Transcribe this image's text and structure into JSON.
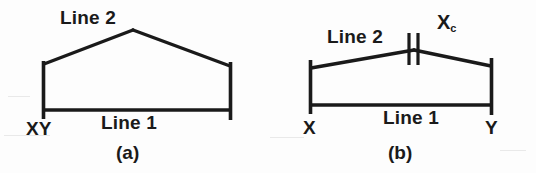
{
  "figure": {
    "background_color": "#fdfdfd",
    "ink_color": "#1a1a1a",
    "panels": [
      {
        "id": "a",
        "caption": "(a)",
        "line1_label": "Line 1",
        "line2_label": "Line 2",
        "left_endpoint_label": "XY",
        "right_endpoint_label": "",
        "apex_tick_label": "",
        "geometry": {
          "left_x": 43,
          "right_x": 231,
          "baseline_y": 110,
          "top_left_y": 64,
          "top_right_y": 66,
          "apex_x": 133,
          "apex_y": 30
        }
      },
      {
        "id": "b",
        "caption": "(b)",
        "line1_label": "Line 1",
        "line2_label": "Line 2",
        "left_endpoint_label": "X",
        "right_endpoint_label": "Y",
        "apex_tick_label": "X",
        "apex_tick_subscript": "c",
        "geometry": {
          "left_x": 310,
          "right_x": 492,
          "baseline_y": 105,
          "top_left_y": 68,
          "top_right_y": 66,
          "apex_x": 414,
          "apex_y": 50
        }
      }
    ]
  }
}
